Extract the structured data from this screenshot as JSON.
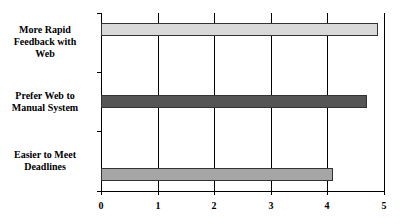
{
  "chart_data": {
    "type": "bar",
    "orientation": "horizontal",
    "title": "",
    "xlabel": "",
    "ylabel": "",
    "categories": [
      "More Rapid Feedback with Web",
      "Prefer Web to Manual System",
      "Easier to Meet Deadlines"
    ],
    "values": [
      4.9,
      4.7,
      4.1
    ],
    "colors": [
      "#d9d9d9",
      "#555555",
      "#a6a6a6"
    ],
    "xlim": [
      0,
      5
    ],
    "xticks": [
      0,
      1,
      2,
      3,
      4,
      5
    ],
    "grid": true,
    "legend": null
  },
  "labels": {
    "cat0": [
      "More Rapid",
      "Feedback with",
      "Web"
    ],
    "cat1": [
      "Prefer Web to",
      "Manual System"
    ],
    "cat2": [
      "Easier to Meet",
      "Deadlines"
    ],
    "x0": "0",
    "x1": "1",
    "x2": "2",
    "x3": "3",
    "x4": "4",
    "x5": "5"
  }
}
